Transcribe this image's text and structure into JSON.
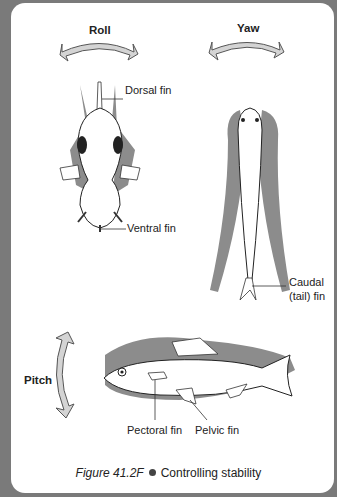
{
  "figure": {
    "number": "Figure 41.2F",
    "title": "Controlling stability"
  },
  "labels": {
    "roll": "Roll",
    "yaw": "Yaw",
    "pitch": "Pitch",
    "dorsal_fin": "Dorsal fin",
    "ventral_fin": "Ventral fin",
    "caudal_fin_line1": "Caudal",
    "caudal_fin_line2": "(tail) fin",
    "pectoral_fin": "Pectoral fin",
    "pelvic_fin": "Pelvic fin"
  },
  "colors": {
    "frame": "#7a7a7a",
    "shadow": "#8c8c8c",
    "arrow_fill": "#d4d4d4"
  }
}
